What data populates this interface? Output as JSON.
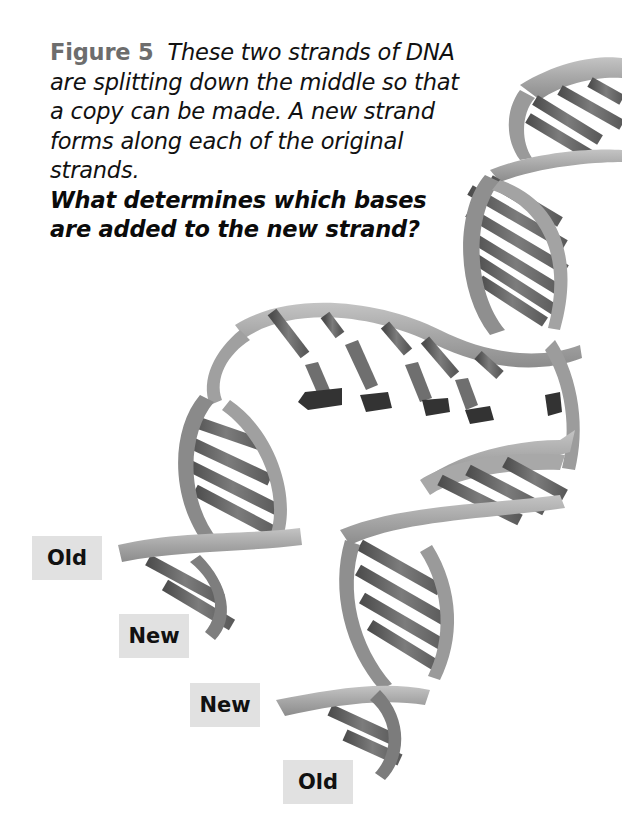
{
  "figure": {
    "number_label": "Figure 5",
    "caption_text": "These two strands of DNA are splitting down the middle so that a copy can be made. A new strand forms along each of the original strands.",
    "question": "What determines which bases are added to the new strand?"
  },
  "labels": [
    {
      "id": "old-top",
      "text": "Old"
    },
    {
      "id": "new-top",
      "text": "New"
    },
    {
      "id": "new-bottom",
      "text": "New"
    },
    {
      "id": "old-bottom",
      "text": "Old"
    }
  ],
  "colors": {
    "background": "#ffffff",
    "figure_label": "#6d6d6d",
    "label_box": "#e1e1e1",
    "backbone": "#a8a8a8",
    "base_dark": "#555555",
    "base_mid": "#7a7a7a",
    "free_nucleotide": "#3a3a3a"
  }
}
